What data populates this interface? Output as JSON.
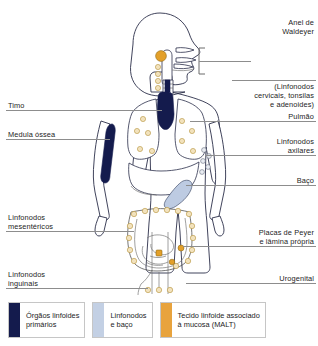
{
  "labels_left": [
    {
      "id": "timo",
      "text": "Timo"
    },
    {
      "id": "medula-ossea",
      "text": "Medula óssea"
    },
    {
      "id": "linfonodos-mesentericos",
      "text": "Linfonodos\nmesentéricos"
    },
    {
      "id": "linfonodos-inguinais",
      "text": "Linfonodos\ninguinais"
    }
  ],
  "labels_right": [
    {
      "id": "anel-de-waldeyer",
      "text": "Anel de\nWaldeyer"
    },
    {
      "id": "anel-de-waldeyer-sub",
      "text": "(Linfonodos\ncervicais, tonsilas\ne adenoides)"
    },
    {
      "id": "pulmao",
      "text": "Pulmão"
    },
    {
      "id": "linfonodos-axilares",
      "text": "Linfonodos\naxilares"
    },
    {
      "id": "baco",
      "text": "Baço"
    },
    {
      "id": "placas-de-peyer",
      "text": "Placas de Peyer\ne lâmina própria"
    },
    {
      "id": "urogenital",
      "text": "Urogenital"
    }
  ],
  "legend": {
    "items": [
      {
        "id": "orgaos-linfoides-primarios",
        "label": "Órgãos linfoides\nprimários",
        "color": "#141b4d"
      },
      {
        "id": "linfonodos-e-baco",
        "label": "Linfonodos\ne baço",
        "color": "#c3d0e4"
      },
      {
        "id": "malt",
        "label": "Tecido linfoide associado\nà mucosa (MALT)",
        "color": "#e8a33d"
      }
    ]
  },
  "colors": {
    "primary_lymphoid": "#141b4d",
    "nodes_and_spleen": "#c3d0e4",
    "malt": "#e8a33d",
    "outline": "#2b2f4a",
    "leader_line": "#8d8d8d",
    "background": "#ffffff"
  },
  "anatomy": {
    "parts": [
      "head",
      "neck",
      "torso",
      "arms",
      "legs",
      "thymus",
      "bone-marrow",
      "lungs",
      "spleen",
      "liver",
      "large-intestine",
      "small-intestine",
      "tonsils-adenoids",
      "cervical-lymph-nodes",
      "axillary-lymph-nodes",
      "mesenteric-lymph-nodes",
      "inguinal-lymph-nodes",
      "peyer-patches"
    ]
  }
}
